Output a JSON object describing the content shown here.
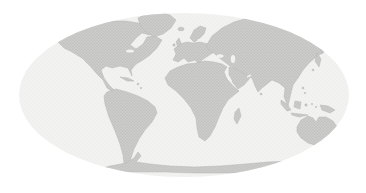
{
  "map": {
    "kind": "world-map",
    "projection": "elliptical-pseudocylindrical",
    "colors": {
      "background": "#ffffff",
      "ocean": "#f2f2f1",
      "ocean_texture": "#e5e5e4",
      "land": "#cccccb",
      "land_texture": "#b2b2b1",
      "coastline": "#b7b7b6"
    },
    "landmasses": [
      "North America",
      "Greenland",
      "South America",
      "Europe",
      "Africa",
      "Asia",
      "Australia",
      "Antarctica"
    ],
    "islands": [
      "Iceland",
      "British Isles",
      "Madagascar",
      "Japan",
      "Indonesia",
      "New Guinea",
      "Philippines",
      "New Zealand",
      "Tasmania",
      "Caribbean"
    ]
  }
}
